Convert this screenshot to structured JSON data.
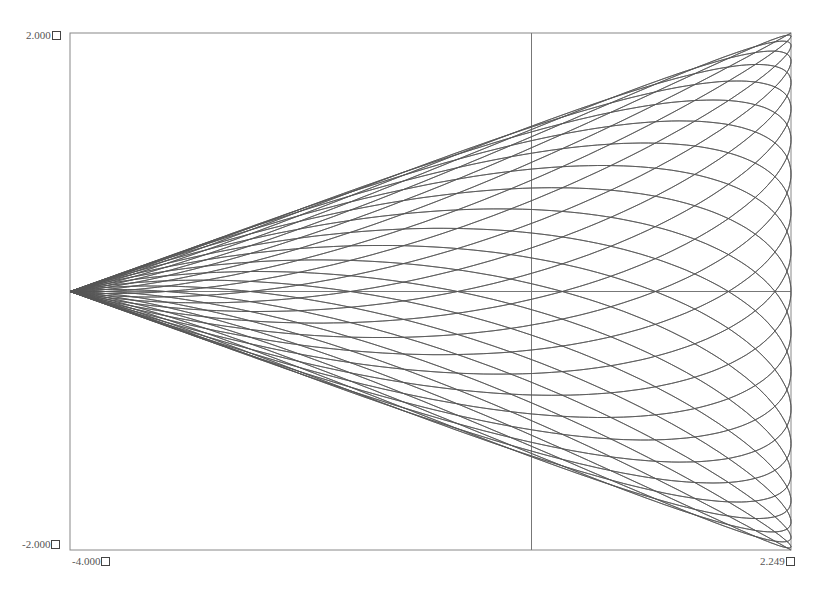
{
  "chart_data": {
    "type": "line",
    "title": "",
    "xlabel": "",
    "ylabel": "",
    "xlim": [
      -4.0,
      2.249
    ],
    "ylim": [
      -2.0,
      2.0
    ],
    "grid": false,
    "axes_through_origin": true,
    "tick_labels": {
      "y_max": "2.000",
      "y_min": "-2.000",
      "x_min": "-4.000",
      "x_max": "2.249"
    },
    "series": [
      {
        "name": "parametric-curve",
        "color": "#555555",
        "param": {
          "x_center": -0.8755,
          "x_amp": 3.1245,
          "y_amp": 2.0,
          "turns": 40,
          "steps": 9000
        }
      }
    ]
  },
  "frame": {
    "left": 70,
    "top": 33,
    "right": 791,
    "bottom": 550,
    "color": "#888888"
  }
}
